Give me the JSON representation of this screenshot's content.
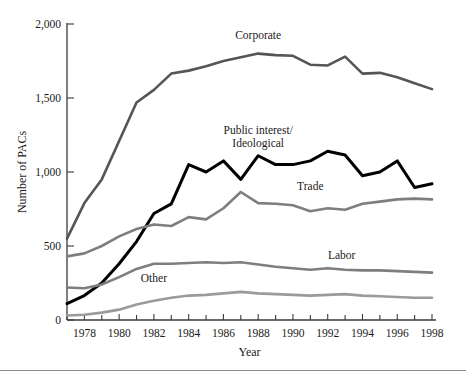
{
  "figure": {
    "background_color": "#ffffff",
    "rule_color": "#8c8c8c"
  },
  "chart_data": {
    "type": "line",
    "title": "",
    "xlabel": "Year",
    "ylabel": "Number of PACs",
    "xlim": [
      1977,
      1998
    ],
    "ylim": [
      0,
      2000
    ],
    "grid": false,
    "legend": "inline-labels",
    "x": [
      1977,
      1978,
      1979,
      1980,
      1981,
      1982,
      1983,
      1984,
      1985,
      1986,
      1987,
      1988,
      1989,
      1990,
      1991,
      1992,
      1993,
      1994,
      1995,
      1996,
      1997,
      1998
    ],
    "y_ticks": [
      0,
      500,
      1000,
      1500,
      2000
    ],
    "y_tick_labels": [
      "0",
      "500",
      "1,000",
      "1,500",
      "2,000"
    ],
    "x_major_ticks": [
      1978,
      1980,
      1982,
      1984,
      1986,
      1988,
      1990,
      1992,
      1994,
      1996,
      1998
    ],
    "x_major_tick_labels": [
      "1978",
      "1980",
      "1982",
      "1984",
      "1986",
      "1988",
      "1990",
      "1992",
      "1994",
      "1996",
      "1998"
    ],
    "x_minor_ticks": [
      1977,
      1979,
      1981,
      1983,
      1985,
      1987,
      1989,
      1991,
      1993,
      1995,
      1997
    ],
    "series": [
      {
        "name": "Corporate",
        "color": "#555555",
        "width": 2.6,
        "label_x": 1988.0,
        "label_y": 1900,
        "values": [
          550,
          790,
          950,
          1210,
          1470,
          1555,
          1665,
          1685,
          1715,
          1750,
          1775,
          1800,
          1790,
          1785,
          1725,
          1720,
          1780,
          1665,
          1670,
          1640,
          1600,
          1560
        ]
      },
      {
        "name": "Public interest/\nIdeological",
        "name_line1": "Public interest/",
        "name_line2": "Ideological",
        "color": "#000000",
        "width": 3.0,
        "label_x": 1988.0,
        "label_y": 1255,
        "values": [
          110,
          165,
          250,
          380,
          530,
          720,
          785,
          1050,
          1000,
          1075,
          950,
          1110,
          1050,
          1050,
          1075,
          1140,
          1115,
          975,
          1000,
          1075,
          895,
          920
        ]
      },
      {
        "name": "Trade",
        "color": "#7e7e7e",
        "width": 2.6,
        "label_x": 1991.0,
        "label_y": 880,
        "values": [
          430,
          450,
          500,
          565,
          615,
          645,
          635,
          695,
          680,
          755,
          865,
          790,
          785,
          775,
          735,
          755,
          745,
          785,
          800,
          815,
          820,
          815
        ]
      },
      {
        "name": "Labor",
        "color": "#7e7e7e",
        "width": 2.6,
        "label_x": 1992.8,
        "label_y": 415,
        "values": [
          220,
          215,
          240,
          290,
          345,
          380,
          380,
          385,
          390,
          385,
          390,
          375,
          360,
          350,
          340,
          350,
          340,
          335,
          335,
          330,
          325,
          320
        ]
      },
      {
        "name": "Other",
        "color": "#9a9a9a",
        "width": 2.6,
        "label_x": 1982.0,
        "label_y": 255,
        "values": [
          30,
          35,
          50,
          70,
          105,
          130,
          150,
          165,
          170,
          180,
          190,
          180,
          175,
          170,
          165,
          170,
          175,
          165,
          160,
          155,
          150,
          150
        ]
      }
    ]
  }
}
